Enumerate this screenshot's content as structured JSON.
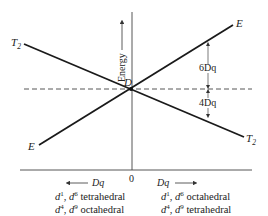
{
  "diagram": {
    "type": "Orgel diagram (d1/d6/d4/d9 crystal field splitting)",
    "axis_labels": {
      "y": "Energy",
      "x_origin": "0",
      "x_left": "Dq",
      "x_right": "Dq"
    },
    "point_label": "D",
    "line_labels": {
      "upper_left": "T",
      "upper_left_sub": "2",
      "upper_right": "E",
      "lower_left": "E",
      "lower_right": "T",
      "lower_right_sub": "2"
    },
    "splitting": {
      "upper": "6Dq",
      "lower": "4Dq"
    },
    "captions": {
      "left": [
        {
          "a": "d",
          "a_sup": "1",
          "sep": ", ",
          "b": "d",
          "b_sup": "6",
          "text": " tetrahedral"
        },
        {
          "a": "d",
          "a_sup": "4",
          "sep": ", ",
          "b": "d",
          "b_sup": "9",
          "text": " octahedral"
        }
      ],
      "right": [
        {
          "a": "d",
          "a_sup": "1",
          "sep": ", ",
          "b": "d",
          "b_sup": "6",
          "text": " octahedral"
        },
        {
          "a": "d",
          "a_sup": "4",
          "sep": ", ",
          "b": "d",
          "b_sup": "9",
          "text": " tetrahedral"
        }
      ]
    },
    "colors": {
      "line": "#1a1a1a",
      "axis": "#333333",
      "text": "#222222"
    }
  }
}
